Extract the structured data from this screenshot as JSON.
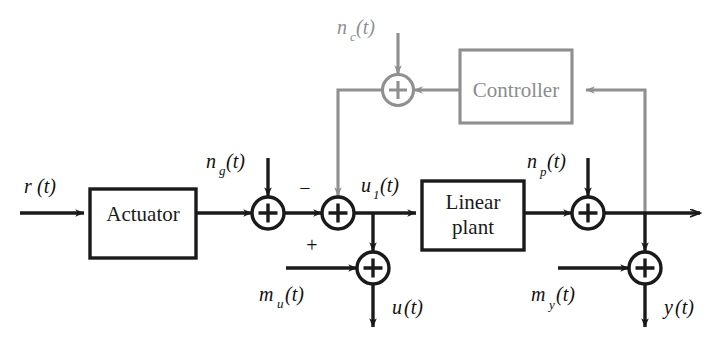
{
  "diagram": {
    "colors": {
      "black": "#1a1a1a",
      "gray": "#8f8f8f",
      "background": "#ffffff"
    },
    "blocks": [
      {
        "id": "actuator",
        "label": "Actuator",
        "color": "black"
      },
      {
        "id": "linear-plant",
        "label_line1": "Linear",
        "label_line2": "plant",
        "color": "black"
      },
      {
        "id": "controller",
        "label": "Controller",
        "color": "gray"
      }
    ],
    "signals": {
      "reference": {
        "base": "r",
        "sub": "",
        "arg": "(t)",
        "color": "black"
      },
      "actuator_noise": {
        "base": "n",
        "sub": "g",
        "arg": "(t)",
        "color": "black"
      },
      "controller_noise": {
        "base": "n",
        "sub": "c",
        "arg": "(t)",
        "color": "gray"
      },
      "control_input": {
        "base": "u",
        "sub": "1",
        "arg": "(t)",
        "color": "black"
      },
      "plant_noise": {
        "base": "n",
        "sub": "p",
        "arg": "(t)",
        "color": "black"
      },
      "input_measurement": {
        "base": "m",
        "sub": "u",
        "arg": "(t)",
        "color": "black"
      },
      "output_measurement": {
        "base": "m",
        "sub": "y",
        "arg": "(t)",
        "color": "black"
      },
      "measured_input": {
        "base": "u",
        "sub": "",
        "arg": "(t)",
        "color": "black"
      },
      "measured_output": {
        "base": "y",
        "sub": "",
        "arg": "(t)",
        "color": "black"
      }
    },
    "summing_junctions": [
      {
        "id": "actuator-noise-sum",
        "operator": "+",
        "color": "black"
      },
      {
        "id": "error-sum",
        "operator": "+",
        "color": "black",
        "sign_top": "−",
        "sign_bottom": "+"
      },
      {
        "id": "plant-noise-sum",
        "operator": "+",
        "color": "black"
      },
      {
        "id": "input-measure-sum",
        "operator": "+",
        "color": "black"
      },
      {
        "id": "output-measure-sum",
        "operator": "+",
        "color": "black"
      },
      {
        "id": "controller-noise-sum",
        "operator": "+",
        "color": "gray"
      }
    ]
  }
}
